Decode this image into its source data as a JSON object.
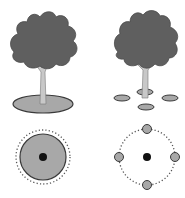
{
  "diagram": {
    "title": "",
    "panels": [
      {
        "id": "single-ring",
        "side_view": {
          "tree": "tree with single mulch ring",
          "ground": "one large ellipse around trunk"
        },
        "top_view": {
          "center": "trunk",
          "ring": "solid filled circle",
          "dripline": "dotted circle"
        }
      },
      {
        "id": "multiple-spots",
        "side_view": {
          "tree": "tree with four small spots",
          "ground": "four small ellipses around trunk"
        },
        "top_view": {
          "center": "trunk",
          "spots": 4,
          "dripline": "dotted circle"
        }
      }
    ],
    "colors": {
      "canopy": "#5f5f5f",
      "trunk": "#c8c8c8",
      "ground_fill": "#a8a8a8",
      "outline": "#3a3a3a",
      "center_dot": "#111111",
      "dotted": "#555555"
    }
  }
}
